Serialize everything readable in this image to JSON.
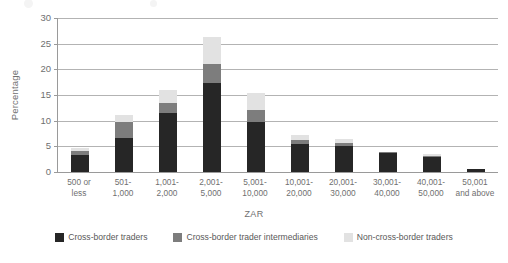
{
  "chart_data": {
    "type": "bar",
    "subtype": "stacked-vertical",
    "title": "",
    "xlabel": "ZAR",
    "ylabel": "Percentage",
    "ylim": [
      0,
      30
    ],
    "yticks": [
      0,
      5,
      10,
      15,
      20,
      25,
      30
    ],
    "ytick_labels": [
      "0",
      "5",
      "10",
      "15",
      "20",
      "25",
      "30"
    ],
    "grid": "horizontal",
    "legend_position": "bottom",
    "categories": [
      "500 or less",
      "501-1,000",
      "1,001-2,000",
      "2,001-5,000",
      "5,001-10,000",
      "10,001-20,000",
      "20,001-30,000",
      "30,001-40,000",
      "40,001-50,000",
      "50,001 and above"
    ],
    "category_lines": [
      [
        "500 or",
        "less"
      ],
      [
        "501-",
        "1,000"
      ],
      [
        "1,001-",
        "2,000"
      ],
      [
        "2,001-",
        "5,000"
      ],
      [
        "5,001-",
        "10,000"
      ],
      [
        "10,001-",
        "20,000"
      ],
      [
        "20,001-",
        "30,000"
      ],
      [
        "30,001-",
        "40,000"
      ],
      [
        "40,001-",
        "50,000"
      ],
      [
        "50,001",
        "and above"
      ]
    ],
    "series": [
      {
        "name": "Cross-border traders",
        "color": "#262626",
        "values": [
          3.4,
          6.6,
          11.5,
          17.3,
          9.7,
          5.5,
          5.1,
          3.7,
          2.9,
          0.5
        ]
      },
      {
        "name": "Cross-border trader intermediaries",
        "color": "#7d7d7d",
        "values": [
          0.6,
          3.1,
          2.0,
          3.7,
          2.4,
          0.8,
          0.5,
          0.2,
          0.3,
          0.1
        ]
      },
      {
        "name": "Non-cross-border traders",
        "color": "#e2e2e2",
        "values": [
          0.6,
          1.4,
          2.5,
          5.3,
          3.3,
          0.9,
          0.8,
          0.1,
          0.3,
          0.0
        ]
      }
    ],
    "totals": [
      4.6,
      11.1,
      16.0,
      26.3,
      15.4,
      7.2,
      6.4,
      4.0,
      3.5,
      0.6
    ]
  },
  "legend": {
    "items": [
      {
        "label": "Cross-border traders",
        "color": "#262626"
      },
      {
        "label": "Cross-border trader intermediaries",
        "color": "#7d7d7d"
      },
      {
        "label": "Non-cross-border traders",
        "color": "#e2e2e2"
      }
    ]
  },
  "axes": {
    "x_title": "ZAR",
    "y_title": "Percentage"
  }
}
